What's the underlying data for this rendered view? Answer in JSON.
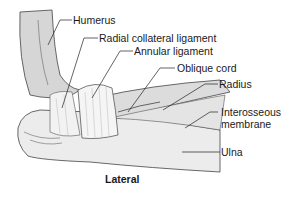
{
  "figure": {
    "view": "Lateral",
    "labels": [
      {
        "id": "humerus",
        "text": "Humerus"
      },
      {
        "id": "radial-collateral-ligament",
        "text": "Radial collateral ligament"
      },
      {
        "id": "annular-ligament",
        "text": "Annular ligament"
      },
      {
        "id": "oblique-cord",
        "text": "Oblique cord"
      },
      {
        "id": "radius",
        "text": "Radius"
      },
      {
        "id": "interosseous-membrane",
        "text": "Interosseous membrane",
        "line1": "Interosseous",
        "line2": "membrane"
      },
      {
        "id": "ulna",
        "text": "Ulna"
      }
    ]
  }
}
